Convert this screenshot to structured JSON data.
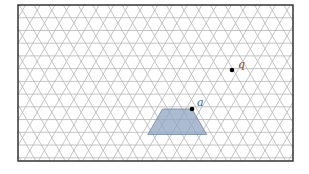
{
  "diagram": {
    "type": "isometric-triangular-grid",
    "frame": {
      "x": 18,
      "y": 5,
      "width": 275,
      "height": 156
    },
    "grid": {
      "side": 14.7,
      "row_height": 12.73,
      "line_color": "#b5b5b5",
      "border_color": "#333333"
    },
    "shape": {
      "kind": "trapezoid",
      "fill": "#8fa6c3",
      "stroke": "#6f86a6",
      "vertices": [
        [
          162.5,
          109.0
        ],
        [
          192.0,
          109.0
        ],
        [
          206.7,
          134.5
        ],
        [
          147.8,
          134.5
        ]
      ]
    },
    "points": [
      {
        "id": "a",
        "label": "a",
        "x": 192.0,
        "y": 109.0,
        "label_x": 197,
        "label_y": 106,
        "label_color": "#3d5f9e"
      },
      {
        "id": "q",
        "label": "q",
        "x": 232.0,
        "y": 70.0,
        "label_x": 238,
        "label_y": 68,
        "label_color": "#a0392f"
      }
    ]
  }
}
